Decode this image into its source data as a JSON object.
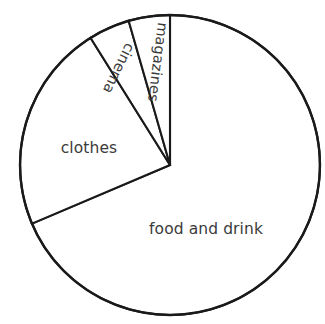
{
  "chart_data": {
    "type": "pie",
    "title": "",
    "subtitle": "",
    "xlabel": "",
    "ylabel": "",
    "legend_position": "none",
    "grid": false,
    "labels_on_slices": true,
    "units": "percent",
    "categories": [
      "food and drink",
      "clothes",
      "cinema",
      "magazines"
    ],
    "values": [
      68.6,
      22.5,
      4.4,
      4.4
    ],
    "angles_degrees": [
      247,
      81,
      16,
      16
    ],
    "slices": [
      {
        "name": "food and drink",
        "label": "food and drink",
        "value": 68.6,
        "angle_degrees": 247,
        "start_angle": 0,
        "end_angle": 247,
        "label_rotation": 0,
        "label_x": 206,
        "label_y": 229,
        "fill": "#ffffff",
        "stroke": "#1a1a1a"
      },
      {
        "name": "clothes",
        "label": "clothes",
        "value": 22.5,
        "angle_degrees": 81,
        "start_angle": 247,
        "end_angle": 328,
        "label_rotation": 0,
        "label_x": 89,
        "label_y": 148,
        "fill": "#ffffff",
        "stroke": "#1a1a1a"
      },
      {
        "name": "cinema",
        "label": "cinema",
        "value": 4.4,
        "angle_degrees": 16,
        "start_angle": 328,
        "end_angle": 344,
        "label_rotation": 116,
        "label_x": 118,
        "label_y": 68,
        "fill": "#ffffff",
        "stroke": "#1a1a1a"
      },
      {
        "name": "magazines",
        "label": "magazines",
        "value": 4.4,
        "angle_degrees": 16,
        "start_angle": 344,
        "end_angle": 360,
        "label_rotation": 97,
        "label_x": 157,
        "label_y": 62,
        "fill": "#ffffff",
        "stroke": "#1a1a1a"
      }
    ],
    "geometry": {
      "center_x": 170,
      "center_y": 165,
      "radius": 150
    },
    "colors": {
      "background": "#ffffff",
      "slice_fill": "#ffffff",
      "stroke": "#1a1a1a",
      "label_text": "#3b3b3b"
    }
  }
}
